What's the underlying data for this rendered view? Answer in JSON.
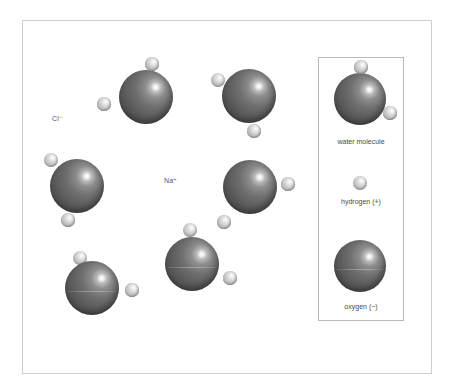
{
  "figure": {
    "background_color": "#ffffff",
    "frame_color": "#cfcfcf",
    "legend_border_color": "#b9b9b9",
    "oxygen_color": "#5d5d5d",
    "hydrogen_color": "#c2c2c2"
  },
  "ion_labels": [
    {
      "name": "chloride-ion-label",
      "text": "Cl⁻",
      "x": 52,
      "y": 115
    },
    {
      "name": "sodium-ion-label",
      "text": "Na⁺",
      "x": 164,
      "y": 177
    }
  ],
  "molecules": [
    {
      "id": "water-molecule-top-left",
      "oxygen": {
        "cx": 146,
        "cy": 97,
        "r": 27
      },
      "hydrogens": [
        {
          "cx": 152,
          "cy": 64,
          "r": 7
        },
        {
          "cx": 104,
          "cy": 104,
          "r": 7
        }
      ]
    },
    {
      "id": "water-molecule-top-right",
      "oxygen": {
        "cx": 249,
        "cy": 96,
        "r": 27
      },
      "hydrogens": [
        {
          "cx": 218,
          "cy": 80,
          "r": 7
        },
        {
          "cx": 254,
          "cy": 131,
          "r": 7
        }
      ]
    },
    {
      "id": "water-molecule-middle-left",
      "oxygen": {
        "cx": 77,
        "cy": 186,
        "r": 27
      },
      "hydrogens": [
        {
          "cx": 51,
          "cy": 160,
          "r": 7
        },
        {
          "cx": 68,
          "cy": 220,
          "r": 7
        }
      ]
    },
    {
      "id": "water-molecule-middle-right",
      "oxygen": {
        "cx": 250,
        "cy": 187,
        "r": 27
      },
      "hydrogens": [
        {
          "cx": 288,
          "cy": 184,
          "r": 7
        },
        {
          "cx": 224,
          "cy": 222,
          "r": 7
        }
      ]
    },
    {
      "id": "water-molecule-bottom-left",
      "oxygen": {
        "cx": 92,
        "cy": 288,
        "r": 27
      },
      "hydrogens": [
        {
          "cx": 80,
          "cy": 258,
          "r": 7
        },
        {
          "cx": 132,
          "cy": 290,
          "r": 7
        }
      ]
    },
    {
      "id": "water-molecule-bottom-center",
      "oxygen": {
        "cx": 192,
        "cy": 264,
        "r": 27
      },
      "hydrogens": [
        {
          "cx": 190,
          "cy": 230,
          "r": 7
        },
        {
          "cx": 230,
          "cy": 278,
          "r": 7
        }
      ]
    }
  ],
  "legend": {
    "box": {
      "x": 318,
      "y": 57,
      "width": 86,
      "height": 264
    },
    "items": [
      {
        "id": "legend-water-molecule",
        "label": "water molecule",
        "label_y": 138,
        "oxygen": {
          "cx": 360,
          "cy": 99,
          "r": 26
        },
        "hydrogens": [
          {
            "cx": 361,
            "cy": 67,
            "r": 7
          },
          {
            "cx": 390,
            "cy": 113,
            "r": 7
          }
        ]
      },
      {
        "id": "legend-hydrogen",
        "label": "hydrogen (+)",
        "label_y": 198,
        "hydrogens": [
          {
            "cx": 360,
            "cy": 183,
            "r": 7
          }
        ]
      },
      {
        "id": "legend-oxygen",
        "label": "oxygen (−)",
        "label_y": 303,
        "oxygen": {
          "cx": 360,
          "cy": 266,
          "r": 26
        }
      }
    ]
  }
}
